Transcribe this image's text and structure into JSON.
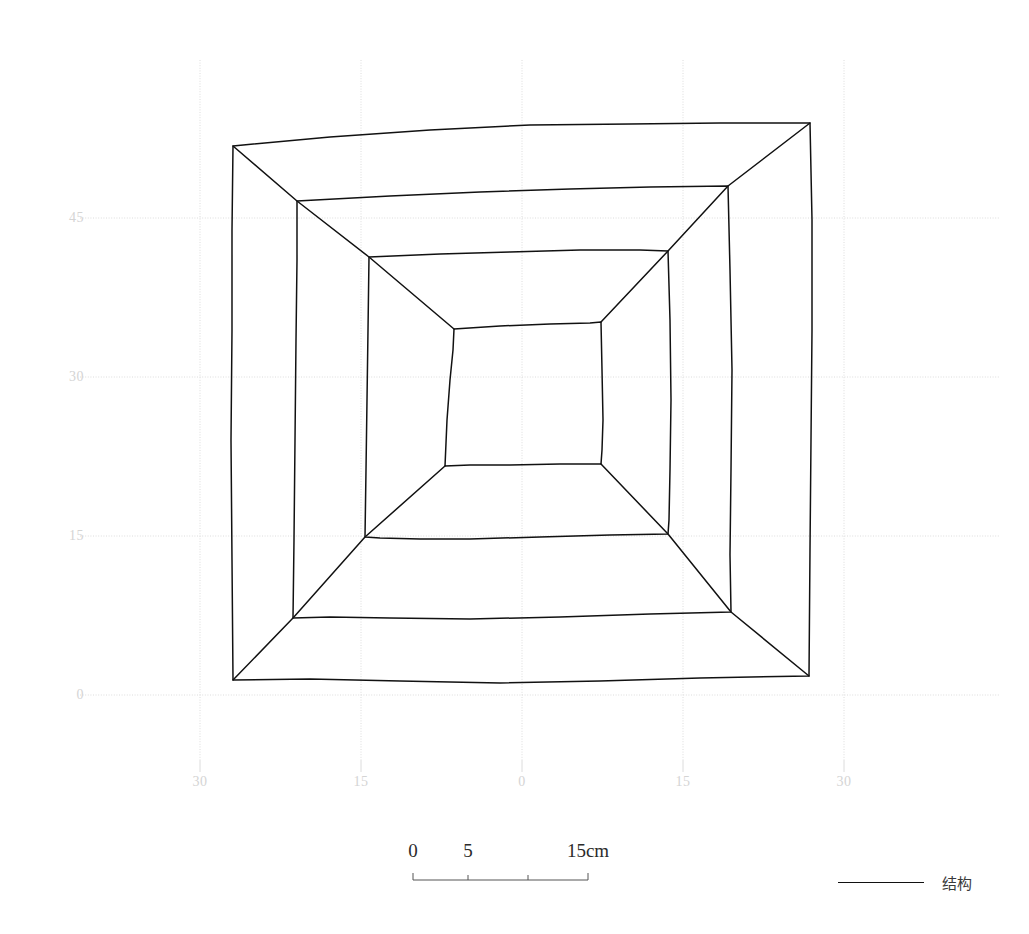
{
  "figure": {
    "type": "archaeological-plan",
    "background_color": "#ffffff",
    "line_color": "#111111",
    "grid_color": "#dcdcdc",
    "tick_label_color": "#d4d4d4"
  },
  "axes": {
    "y_ticks": [
      {
        "label": "45",
        "value": 45,
        "px_y": 218
      },
      {
        "label": "30",
        "value": 30,
        "px_y": 377
      },
      {
        "label": "15",
        "value": 15,
        "px_y": 536
      },
      {
        "label": "0",
        "value": 0,
        "px_y": 695
      }
    ],
    "x_ticks": [
      {
        "label": "30",
        "value": -30,
        "px_x": 200
      },
      {
        "label": "15",
        "value": -15,
        "px_x": 361
      },
      {
        "label": "0",
        "value": 0,
        "px_x": 522
      },
      {
        "label": "15",
        "value": 15,
        "px_x": 683
      },
      {
        "label": "30",
        "value": 30,
        "px_x": 844
      }
    ]
  },
  "scalebar": {
    "ticks": [
      {
        "label": "0",
        "px_x": 413
      },
      {
        "label": "5",
        "px_x": 468
      },
      {
        "label": "15cm",
        "px_x": 588
      }
    ],
    "bar_start_px": 413,
    "bar_end_px": 588,
    "minor_tick_px": [
      468,
      528
    ]
  },
  "legend": {
    "items": [
      {
        "label": "结构",
        "color": "#111111",
        "style": "solid-line"
      }
    ]
  },
  "chart_data": {
    "type": "line",
    "title": "",
    "xlabel": "",
    "ylabel": "",
    "xlim": [
      -33,
      33
    ],
    "ylim": [
      -2,
      55
    ],
    "grid": true,
    "legend_position": "bottom-right",
    "rings": [
      {
        "name": "outer-ring",
        "points_px": [
          [
            233,
            146
          ],
          [
            330,
            137
          ],
          [
            430,
            130
          ],
          [
            530,
            125
          ],
          [
            630,
            124
          ],
          [
            720,
            123
          ],
          [
            810,
            123
          ],
          [
            812,
            220
          ],
          [
            812,
            330
          ],
          [
            811,
            440
          ],
          [
            810,
            550
          ],
          [
            809,
            676
          ],
          [
            700,
            678
          ],
          [
            600,
            681
          ],
          [
            500,
            683
          ],
          [
            400,
            681
          ],
          [
            310,
            679
          ],
          [
            233,
            680
          ],
          [
            232,
            560
          ],
          [
            231,
            440
          ],
          [
            232,
            330
          ],
          [
            232,
            230
          ],
          [
            233,
            146
          ]
        ]
      },
      {
        "name": "second-ring",
        "points_px": [
          [
            297,
            201
          ],
          [
            390,
            196
          ],
          [
            480,
            192
          ],
          [
            570,
            189
          ],
          [
            650,
            187
          ],
          [
            728,
            186
          ],
          [
            730,
            270
          ],
          [
            732,
            370
          ],
          [
            731,
            470
          ],
          [
            730,
            555
          ],
          [
            731,
            612
          ],
          [
            650,
            614
          ],
          [
            560,
            617
          ],
          [
            470,
            619
          ],
          [
            390,
            618
          ],
          [
            330,
            617
          ],
          [
            293,
            618
          ],
          [
            294,
            540
          ],
          [
            295,
            440
          ],
          [
            296,
            340
          ],
          [
            297,
            260
          ],
          [
            297,
            201
          ]
        ]
      },
      {
        "name": "third-ring",
        "points_px": [
          [
            369,
            257
          ],
          [
            440,
            254
          ],
          [
            510,
            252
          ],
          [
            580,
            250
          ],
          [
            640,
            250
          ],
          [
            668,
            251
          ],
          [
            670,
            320
          ],
          [
            671,
            400
          ],
          [
            670,
            470
          ],
          [
            669,
            520
          ],
          [
            668,
            534
          ],
          [
            610,
            535
          ],
          [
            540,
            537
          ],
          [
            470,
            539
          ],
          [
            420,
            539
          ],
          [
            380,
            538
          ],
          [
            365,
            537
          ],
          [
            366,
            470
          ],
          [
            367,
            400
          ],
          [
            368,
            330
          ],
          [
            369,
            257
          ]
        ]
      },
      {
        "name": "inner-square",
        "points_px": [
          [
            454,
            329
          ],
          [
            500,
            326
          ],
          [
            550,
            324
          ],
          [
            590,
            323
          ],
          [
            601,
            322
          ],
          [
            602,
            370
          ],
          [
            603,
            420
          ],
          [
            602,
            450
          ],
          [
            601,
            464
          ],
          [
            560,
            464
          ],
          [
            510,
            465
          ],
          [
            470,
            465
          ],
          [
            445,
            466
          ],
          [
            447,
            420
          ],
          [
            450,
            380
          ],
          [
            453,
            350
          ],
          [
            454,
            329
          ]
        ]
      }
    ],
    "corner_ridges": [
      {
        "name": "ridge-top-left",
        "points_px": [
          [
            233,
            146
          ],
          [
            297,
            201
          ],
          [
            369,
            257
          ],
          [
            454,
            329
          ]
        ]
      },
      {
        "name": "ridge-top-right",
        "points_px": [
          [
            810,
            123
          ],
          [
            728,
            186
          ],
          [
            668,
            251
          ],
          [
            601,
            322
          ]
        ]
      },
      {
        "name": "ridge-bottom-right",
        "points_px": [
          [
            809,
            676
          ],
          [
            731,
            612
          ],
          [
            668,
            534
          ],
          [
            601,
            464
          ]
        ]
      },
      {
        "name": "ridge-bottom-left",
        "points_px": [
          [
            233,
            680
          ],
          [
            293,
            618
          ],
          [
            365,
            537
          ],
          [
            445,
            466
          ]
        ]
      }
    ]
  }
}
